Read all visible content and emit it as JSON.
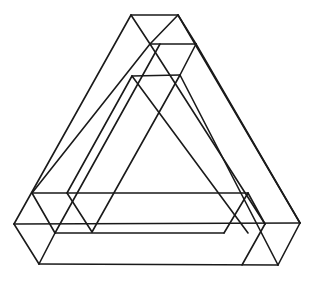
{
  "figure": {
    "title": "",
    "stroke_color": "#1a1a1a",
    "background": "#ffffff"
  }
}
